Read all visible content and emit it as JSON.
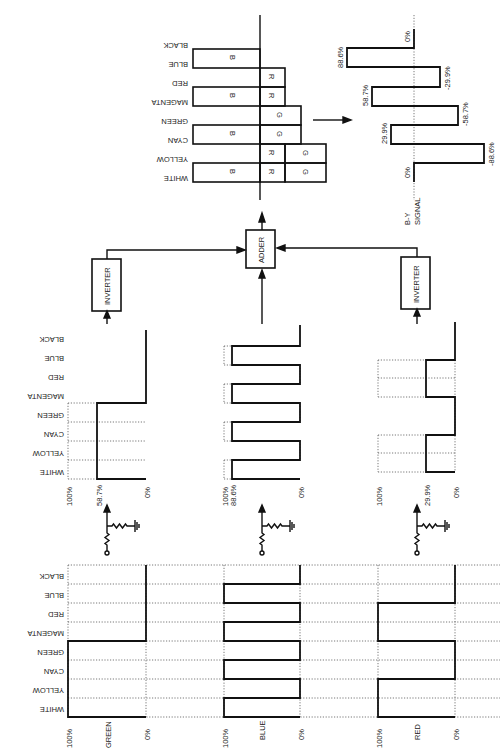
{
  "figure": {
    "orientation": "rotated 90 degrees"
  },
  "bars": [
    "WHITE",
    "YELLOW",
    "CYAN",
    "GREEN",
    "MAGENTA",
    "RED",
    "BLUE",
    "BLACK"
  ],
  "input_signals": [
    {
      "name": "GREEN",
      "top": "100%",
      "bottom": "0%",
      "levels": [
        1,
        1,
        1,
        1,
        0,
        0,
        0,
        0
      ]
    },
    {
      "name": "BLUE",
      "top": "100%",
      "bottom": "0%",
      "levels": [
        1,
        0,
        1,
        0,
        1,
        0,
        1,
        0
      ]
    },
    {
      "name": "RED",
      "top": "100%",
      "bottom": "0%",
      "levels": [
        1,
        1,
        0,
        0,
        1,
        1,
        0,
        0
      ]
    }
  ],
  "attenuated_signals": [
    {
      "name": "green_attenuated",
      "top": "100%",
      "level_label": "58.7%",
      "bottom": "0%",
      "amplitude": 58.7
    },
    {
      "name": "blue_attenuated",
      "top": "100%",
      "level_label": "88.6%",
      "bottom": "0%",
      "amplitude": 88.6
    },
    {
      "name": "red_attenuated",
      "top": "100%",
      "level_label": "29.9%",
      "bottom": "0%",
      "amplitude": 29.9
    }
  ],
  "blocks": {
    "inverter_left": "INVERTER",
    "adder": "ADDER",
    "inverter_right": "INVERTER"
  },
  "adder_output": {
    "rows": [
      {
        "bar": "WHITE",
        "cells": [
          "B",
          "R",
          "G"
        ]
      },
      {
        "bar": "YELLOW",
        "cells": [
          "",
          "R",
          "G"
        ]
      },
      {
        "bar": "CYAN",
        "cells": [
          "B",
          "G"
        ]
      },
      {
        "bar": "GREEN",
        "cells": [
          "",
          "G"
        ]
      },
      {
        "bar": "MAGENTA",
        "cells": [
          "B",
          "R"
        ]
      },
      {
        "bar": "RED",
        "cells": [
          "",
          "R"
        ]
      },
      {
        "bar": "BLUE",
        "cells": [
          "B"
        ]
      },
      {
        "bar": "BLACK",
        "cells": []
      }
    ]
  },
  "by_signal": {
    "label_line1": "B-Y",
    "label_line2": "SIGNAL",
    "values": [
      0,
      -88.6,
      29.9,
      -58.7,
      58.7,
      -29.9,
      88.6,
      0
    ],
    "labels": [
      "0%",
      "-88.6%",
      "29.9%",
      "-58.7%",
      "58.7%",
      "-29.9%",
      "88.6%",
      "0%"
    ]
  }
}
